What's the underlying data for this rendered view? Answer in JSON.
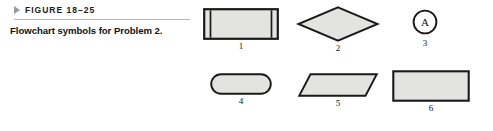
{
  "figure": {
    "marker_icon": "triangle-right-icon",
    "label": "FIGURE 18–25",
    "caption": "Flowchart symbols for Problem 2."
  },
  "style": {
    "shape_fill": "#e3e3e1",
    "shape_stroke": "#1a1a1a",
    "rule_color": "#b5b5b5",
    "marker_color": "#9a9a9a",
    "text_color": "#111111",
    "background": "#ffffff"
  },
  "diagram_data": {
    "type": "diagram",
    "title": "Flowchart symbols for Problem 2.",
    "rows": 2,
    "columns": 3,
    "shapes": [
      {
        "number": "1",
        "symbol": "predefined-process",
        "description": "Rectangle with double vertical bars on left and right sides",
        "row": 1,
        "column": 1,
        "label": ""
      },
      {
        "number": "2",
        "symbol": "decision",
        "description": "Diamond",
        "row": 1,
        "column": 2,
        "label": ""
      },
      {
        "number": "3",
        "symbol": "connector",
        "description": "Circle containing a letter",
        "row": 1,
        "column": 3,
        "label": "A"
      },
      {
        "number": "4",
        "symbol": "terminal",
        "description": "Rounded rectangle (stadium)",
        "row": 2,
        "column": 1,
        "label": ""
      },
      {
        "number": "5",
        "symbol": "input-output",
        "description": "Parallelogram slanted to the right",
        "row": 2,
        "column": 2,
        "label": ""
      },
      {
        "number": "6",
        "symbol": "process",
        "description": "Plain rectangle",
        "row": 2,
        "column": 3,
        "label": ""
      }
    ]
  }
}
